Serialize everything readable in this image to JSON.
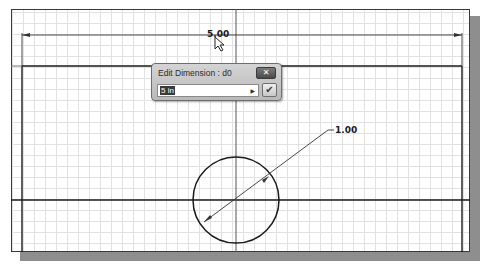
{
  "sketch": {
    "horizontal_dimension": "5.00",
    "diameter_dimension": "1.00"
  },
  "dialog": {
    "title": "Edit Dimension : d0",
    "input_value": "5 in",
    "close_icon": "close-icon",
    "arrow_icon": "triangle-right-icon",
    "accept_icon": "checkmark-icon"
  },
  "colors": {
    "grid": "#e2e2e2",
    "sketch_line": "#1a1a1a",
    "shadow": "#8e8e8e",
    "dialog_bg": "#c8c8c8"
  }
}
